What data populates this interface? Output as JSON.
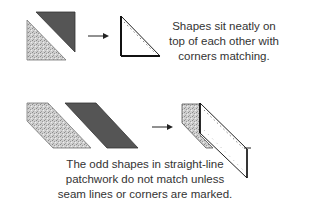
{
  "top_example": {
    "caption_lines": [
      "Shapes sit neatly on",
      "top of each other with",
      "corners matching."
    ],
    "shapes": [
      "light-speckled-triangle",
      "dark-triangle"
    ],
    "result": "stacked-triangle-with-seam-line"
  },
  "bottom_example": {
    "caption_lines": [
      "The odd shapes in straight-line",
      "patchwork do not match unless",
      "seam lines or corners are marked."
    ],
    "shapes": [
      "light-speckled-parallelogram",
      "dark-parallelogram"
    ],
    "result": "offset-parallelograms-with-seam-line"
  },
  "colors": {
    "light_fill": "#c8c8c8",
    "dark_fill": "#555555",
    "outline": "#222222",
    "text": "#333333"
  }
}
